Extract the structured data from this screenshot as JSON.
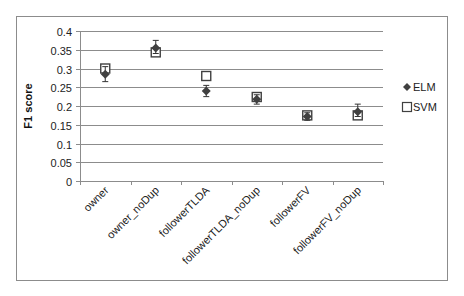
{
  "chart_data": {
    "type": "scatter",
    "title": "",
    "xlabel": "",
    "ylabel": "F1 score",
    "ylim": [
      0,
      0.4
    ],
    "yticks": [
      0,
      0.05,
      0.1,
      0.15,
      0.2,
      0.25,
      0.3,
      0.35,
      0.4
    ],
    "ytick_labels": [
      "0",
      "0.05",
      "0.1",
      "0.15",
      "0.2",
      "0.25",
      "0.3",
      "0.35",
      "0.4"
    ],
    "grid": true,
    "legend_position": "right",
    "categories": [
      "owner",
      "owner_noDup",
      "followerTLDA",
      "followerTLDA_noDup",
      "followerFV",
      "followerFV_noDup"
    ],
    "series": [
      {
        "name": "ELM",
        "marker": "diamond",
        "values": [
          0.285,
          0.355,
          0.24,
          0.218,
          0.172,
          0.185
        ],
        "error_low": [
          0.265,
          0.34,
          0.225,
          0.205,
          0.162,
          0.172
        ],
        "error_high": [
          0.305,
          0.375,
          0.255,
          0.23,
          0.182,
          0.205
        ]
      },
      {
        "name": "SVM",
        "marker": "square",
        "values": [
          0.3,
          0.343,
          0.28,
          0.224,
          0.175,
          0.175
        ]
      }
    ]
  },
  "colors": {
    "elm": "#404040",
    "svm": "#404040",
    "grid": "#8c8c8c",
    "frame": "#8c8c8c"
  }
}
